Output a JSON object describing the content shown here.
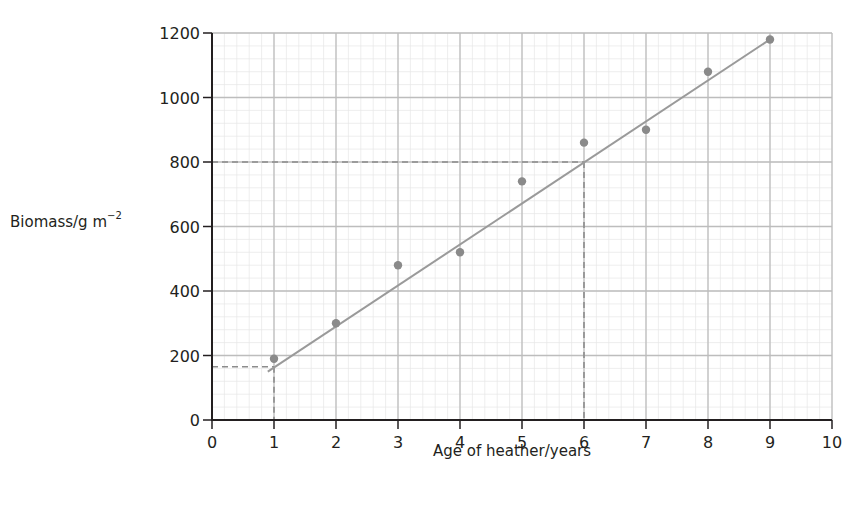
{
  "chart_data": {
    "type": "scatter",
    "title": "",
    "xlabel": "Age of heather/years",
    "ylabel": "Biomass/g m⁻²",
    "ylabel_main": "Biomass/g m",
    "ylabel_sup": "−2",
    "xlim": [
      0,
      10
    ],
    "ylim": [
      0,
      1200
    ],
    "x_ticks": [
      0,
      1,
      2,
      3,
      4,
      5,
      6,
      7,
      8,
      9,
      10
    ],
    "y_ticks": [
      0,
      200,
      400,
      600,
      800,
      1000,
      1200
    ],
    "grid": true,
    "minor_grid_subdivisions": 5,
    "series": [
      {
        "name": "Biomass measurements",
        "x": [
          1,
          2,
          3,
          4,
          5,
          6,
          7,
          8,
          9
        ],
        "y": [
          190,
          300,
          480,
          520,
          740,
          860,
          900,
          1080,
          1180
        ]
      }
    ],
    "best_fit_line": {
      "x_start": 0.9,
      "y_start": 150,
      "x_end": 9,
      "y_end": 1180
    },
    "annotations": [
      {
        "type": "dashed-guide",
        "description": "Reading at x=1",
        "x": 1,
        "y": 165
      },
      {
        "type": "dashed-guide",
        "description": "Reading at x=6",
        "x": 6,
        "y": 800
      }
    ],
    "colors": {
      "points": "#8a8a8a",
      "line": "#9a9a9a",
      "major_grid": "#bdbdbd",
      "minor_grid": "#e6e6e6",
      "axis": "#231f20"
    }
  }
}
